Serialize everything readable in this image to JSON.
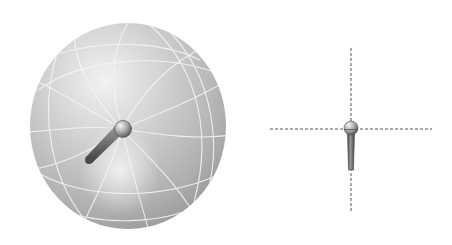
{
  "figure": {
    "description": "Omnidirectional microphone polar pickup pattern",
    "colors": {
      "background": "#ffffff",
      "sphere_light": "#e6e6e6",
      "sphere_mid": "#b9b9b9",
      "sphere_dark": "#8f8f8f",
      "grid_lines": "#f4f4f4",
      "mic_body": "#7a7a7a",
      "mic_head": "#c8c8c8",
      "axis_dash": "#555555"
    },
    "left_panel": {
      "label": "3D pickup sphere",
      "sphere_center": [
        128,
        126
      ],
      "sphere_radius": [
        98,
        103
      ]
    },
    "right_panel": {
      "label": "Top-down mic with axes",
      "axis_center": [
        351,
        129
      ]
    }
  }
}
